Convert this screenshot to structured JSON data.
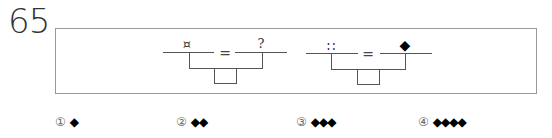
{
  "question": {
    "number": "65",
    "equations": [
      {
        "left_symbol": "¤",
        "equals": "=",
        "right_symbol": "?"
      },
      {
        "left_symbol": "∷",
        "equals": "=",
        "right_symbol": "◆"
      }
    ]
  },
  "options": [
    {
      "marker": "①",
      "value": "◆"
    },
    {
      "marker": "②",
      "value": "◆◆"
    },
    {
      "marker": "③",
      "value": "◆◆◆"
    },
    {
      "marker": "④",
      "value": "◆◆◆◆"
    }
  ]
}
